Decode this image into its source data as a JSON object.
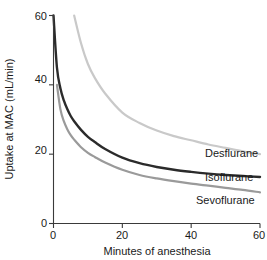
{
  "chart_data": {
    "type": "line",
    "title": "",
    "xlabel": "Minutes of anesthesia",
    "ylabel": "Uptake at MAC (mL/min)",
    "xlim": [
      0,
      60
    ],
    "ylim": [
      0,
      60
    ],
    "xticks": [
      0,
      20,
      40,
      60
    ],
    "yticks": [
      0,
      20,
      40,
      60
    ],
    "xtick_labels": [
      "0",
      "20",
      "40",
      "60"
    ],
    "ytick_labels": [
      "0",
      "20",
      "40",
      "60"
    ],
    "grid": false,
    "legend_position": "inline-right",
    "x": [
      0,
      1,
      2,
      3,
      4,
      5,
      6,
      8,
      10,
      12,
      15,
      20,
      25,
      30,
      35,
      40,
      45,
      50,
      55,
      60
    ],
    "series": [
      {
        "name": "Desflurane",
        "color": "#c9c9c9",
        "line_width": 2.2,
        "values": [
          null,
          null,
          null,
          null,
          null,
          null,
          60.0,
          52.0,
          46.0,
          42.0,
          37.5,
          32.0,
          29.0,
          26.8,
          25.2,
          24.0,
          22.8,
          21.8,
          20.8,
          20.0
        ],
        "label_text": "Desflurane",
        "label_x": 46,
        "label_y": 18.5
      },
      {
        "name": "Isoflurane",
        "color": "#2b2b2b",
        "line_width": 2.4,
        "values": [
          60.0,
          45.0,
          39.0,
          35.5,
          33.0,
          31.0,
          29.5,
          27.0,
          25.0,
          23.5,
          21.5,
          19.0,
          17.4,
          16.3,
          15.5,
          14.9,
          14.4,
          14.0,
          13.7,
          13.4
        ],
        "label_text": "Isoflurane",
        "label_x": 46,
        "label_y": 11.6
      },
      {
        "name": "Sevoflurane",
        "color": "#9a9a9a",
        "line_width": 2.2,
        "values": [
          null,
          40.0,
          33.0,
          29.5,
          27.2,
          25.5,
          24.2,
          22.0,
          20.4,
          19.2,
          17.6,
          15.5,
          14.0,
          13.0,
          12.2,
          11.5,
          10.9,
          10.3,
          9.7,
          9.0
        ],
        "label_text": "Sevoflurane",
        "label_x": 46,
        "label_y": 5.2
      }
    ]
  },
  "axes": {
    "x_title": "Minutes of anesthesia",
    "y_title": "Uptake at MAC (mL/min)",
    "xtick_0": "0",
    "xtick_1": "20",
    "xtick_2": "40",
    "xtick_3": "60",
    "ytick_0": "0",
    "ytick_1": "20",
    "ytick_2": "40",
    "ytick_3": "60"
  },
  "labels": {
    "desflurane": "Desflurane",
    "isoflurane": "Isoflurane",
    "sevoflurane": "Sevoflurane"
  },
  "colors": {
    "desflurane": "#c9c9c9",
    "isoflurane": "#2b2b2b",
    "sevoflurane": "#9a9a9a",
    "axis": "#3a3a3a",
    "text": "#1a1a1a",
    "background": "#ffffff"
  }
}
